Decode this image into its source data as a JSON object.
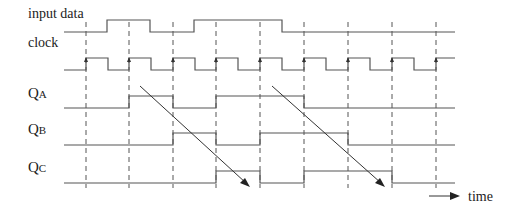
{
  "diagram": {
    "type": "timing-diagram",
    "signals": [
      {
        "id": "input",
        "label": "input data",
        "sub": ""
      },
      {
        "id": "clock",
        "label": "clock",
        "sub": ""
      },
      {
        "id": "qa",
        "label": "Q",
        "sub": "A"
      },
      {
        "id": "qb",
        "label": "Q",
        "sub": "B"
      },
      {
        "id": "qc",
        "label": "Q",
        "sub": "C"
      }
    ],
    "time_label": "time",
    "clock_edges": 9,
    "input_data_levels_per_half_period": "0,0,1,1,0,0,1,1,1,1,0,0,0,0,0,0,0,0",
    "qa_high_periods": [
      [
        2,
        3
      ],
      [
        4,
        6
      ]
    ],
    "qb_high_periods": [
      [
        3,
        4
      ],
      [
        5,
        7
      ]
    ],
    "qc_high_periods": [
      [
        4,
        5
      ],
      [
        6,
        8
      ]
    ],
    "colors": {
      "line": "#555555",
      "text": "#222222",
      "background": "#ffffff"
    }
  }
}
